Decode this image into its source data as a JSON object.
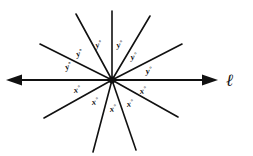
{
  "figure": {
    "background_color": "#ffffff",
    "stroke_color": "#111111",
    "width": 253,
    "height": 156,
    "center": {
      "x": 112,
      "y": 80
    }
  },
  "line_label": {
    "text": "ℓ",
    "name": "line-l"
  },
  "horizontal_line": {
    "name": "line-l-horizontal",
    "left_arrow": "arrow-left",
    "right_arrow": "arrow-right",
    "x1": 8,
    "x2": 216,
    "y": 80
  },
  "rays": [
    {
      "name": "ray-upper-left-shallow",
      "x2": 40,
      "y2": 44
    },
    {
      "name": "ray-upper-left-steep",
      "x2": 76,
      "y2": 14
    },
    {
      "name": "ray-vertical-up",
      "x2": 112,
      "y2": 11
    },
    {
      "name": "ray-upper-right-steep",
      "x2": 150,
      "y2": 16
    },
    {
      "name": "ray-upper-right-shallow",
      "x2": 182,
      "y2": 44
    },
    {
      "name": "ray-lower-left-shallow",
      "x2": 44,
      "y2": 118
    },
    {
      "name": "ray-lower-left-steep",
      "x2": 93,
      "y2": 152
    },
    {
      "name": "ray-lower-right-steep",
      "x2": 136,
      "y2": 150
    },
    {
      "name": "ray-lower-right-shallow",
      "x2": 178,
      "y2": 117
    }
  ],
  "angle_labels": {
    "y_symbol": "y",
    "x_symbol": "x",
    "degree_symbol": "°",
    "upper": [
      {
        "name": "angle-label-y-1",
        "text": "y",
        "x": 66,
        "y": 70
      },
      {
        "name": "angle-label-y-2",
        "text": "y",
        "x": 77,
        "y": 57
      },
      {
        "name": "angle-label-y-3",
        "text": "y",
        "x": 96,
        "y": 48
      },
      {
        "name": "angle-label-y-4",
        "text": "y",
        "x": 117,
        "y": 48
      },
      {
        "name": "angle-label-y-5",
        "text": "y",
        "x": 131,
        "y": 60
      },
      {
        "name": "angle-label-y-6",
        "text": "y",
        "x": 146,
        "y": 74
      }
    ],
    "lower": [
      {
        "name": "angle-label-x-1",
        "text": "x",
        "x": 74,
        "y": 93
      },
      {
        "name": "angle-label-x-2",
        "text": "x",
        "x": 92,
        "y": 105
      },
      {
        "name": "angle-label-x-3",
        "text": "x",
        "x": 110,
        "y": 112
      },
      {
        "name": "angle-label-x-4",
        "text": "x",
        "x": 127,
        "y": 107
      },
      {
        "name": "angle-label-x-5",
        "text": "x",
        "x": 140,
        "y": 94
      }
    ]
  }
}
